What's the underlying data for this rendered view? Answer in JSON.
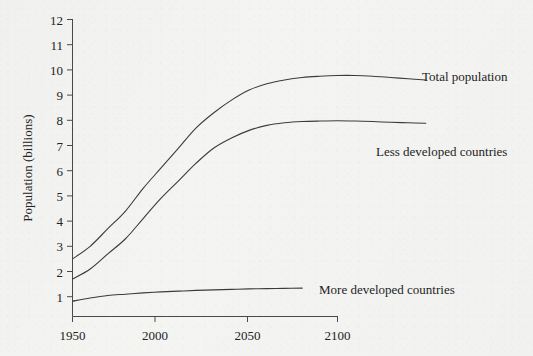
{
  "figure": {
    "background_color": "#f4f4f2",
    "ink_color": "#3b3b3b"
  },
  "chart_data": {
    "type": "line",
    "title": "",
    "xlabel": "",
    "ylabel": "Population (billions)",
    "xlim": [
      1950,
      2150
    ],
    "ylim": [
      0,
      12
    ],
    "xticks": [
      1950,
      2000,
      2050,
      2100
    ],
    "xtick_labels": [
      "1950",
      "2000",
      "2050",
      "2100"
    ],
    "yticks": [
      1,
      2,
      3,
      4,
      5,
      6,
      7,
      8,
      9,
      10,
      11,
      12
    ],
    "ytick_labels": [
      "1",
      "2",
      "3",
      "4",
      "5",
      "6",
      "7",
      "8",
      "9",
      "10",
      "11",
      "12"
    ],
    "grid": false,
    "legend_position": "inline-annotations",
    "x": [
      1950,
      1960,
      1970,
      1980,
      1990,
      2000,
      2010,
      2020,
      2030,
      2040,
      2050,
      2060,
      2070,
      2080,
      2090,
      2100,
      2110,
      2120,
      2130,
      2140,
      2150
    ],
    "series": [
      {
        "name": "Total population",
        "label": "Total population",
        "label_x": 2100,
        "label_y": 10.0,
        "values": [
          2.5,
          3.0,
          3.7,
          4.4,
          5.3,
          6.1,
          6.9,
          7.7,
          8.3,
          8.8,
          9.2,
          9.45,
          9.6,
          9.7,
          9.75,
          9.78,
          9.78,
          9.75,
          9.7,
          9.65,
          9.6
        ]
      },
      {
        "name": "Less developed countries",
        "label": "Less developed countries",
        "label_x": 2088,
        "label_y": 7.1,
        "values": [
          1.7,
          2.1,
          2.7,
          3.3,
          4.1,
          4.9,
          5.6,
          6.3,
          6.9,
          7.3,
          7.6,
          7.8,
          7.9,
          7.95,
          7.97,
          7.98,
          7.97,
          7.95,
          7.92,
          7.9,
          7.88
        ]
      },
      {
        "name": "More developed countries",
        "label": "More developed countries",
        "label_x": 2044,
        "label_y": 1.4,
        "values": [
          0.82,
          0.95,
          1.05,
          1.1,
          1.15,
          1.19,
          1.22,
          1.25,
          1.27,
          1.29,
          1.31,
          1.32,
          1.33,
          1.34,
          1.34,
          1.34,
          1.34,
          1.34,
          1.34,
          1.34,
          1.34
        ]
      }
    ],
    "annotations": [
      {
        "text": "Total population",
        "x": 2102,
        "y": 10.0
      },
      {
        "text": "Less developed countries",
        "x": 2090,
        "y": 7.1
      },
      {
        "text": "More developed countries",
        "x": 2046,
        "y": 1.4
      }
    ]
  }
}
